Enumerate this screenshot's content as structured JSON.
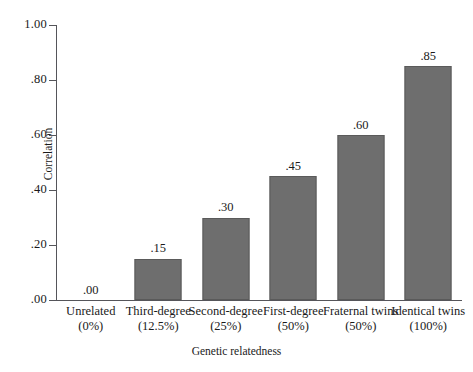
{
  "chart_data": {
    "type": "bar",
    "title": "",
    "xlabel": "Genetic relatedness",
    "ylabel": "Correlation",
    "ylim": [
      0,
      1.0
    ],
    "grid": false,
    "legend": "none",
    "yticks": [
      "1.00",
      ".80",
      ".60",
      ".40",
      ".20",
      ".00"
    ],
    "ytick_values": [
      1.0,
      0.8,
      0.6,
      0.4,
      0.2,
      0.0
    ],
    "categories": [
      "Unrelated",
      "Third-degree",
      "Second-degree",
      "First-degree",
      "Fraternal twins",
      "Identical twins"
    ],
    "category_sublabels": [
      "(0%)",
      "(12.5%)",
      "(25%)",
      "(50%)",
      "(50%)",
      "(100%)"
    ],
    "values": [
      0.0,
      0.15,
      0.3,
      0.45,
      0.6,
      0.85
    ],
    "value_labels": [
      ".00",
      ".15",
      ".30",
      ".45",
      ".60",
      ".85"
    ],
    "bar_color": "#6e6e6e",
    "bar_edge_color": "#5a5a5a",
    "axis_color": "#55555a",
    "background_color": "#ffffff"
  }
}
